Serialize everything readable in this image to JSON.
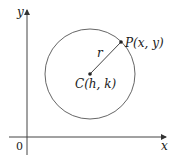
{
  "diagram": {
    "type": "circle-on-coordinate-plane",
    "axes": {
      "x_label": "x",
      "y_label": "y",
      "origin_label": "0"
    },
    "circle": {
      "center_label": "C(h, k)",
      "point_label": "P(x, y)",
      "radius_label": "r"
    },
    "colors": {
      "stroke": "#555555",
      "axis": "#333333",
      "background": "#ffffff"
    }
  }
}
